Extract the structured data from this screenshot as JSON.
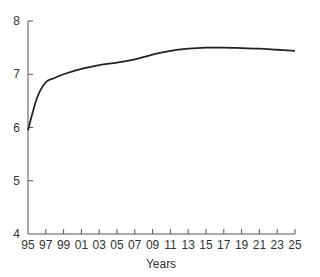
{
  "chart_data": {
    "type": "line",
    "title": "",
    "xlabel": "Years",
    "ylabel": "",
    "x_tick_labels": [
      "95",
      "97",
      "99",
      "01",
      "03",
      "05",
      "07",
      "09",
      "11",
      "13",
      "15",
      "17",
      "19",
      "21",
      "23",
      "25"
    ],
    "y_tick_labels": [
      "4",
      "5",
      "6",
      "7",
      "8"
    ],
    "ylim": [
      4,
      8
    ],
    "xlim": [
      1995,
      2025
    ],
    "grid": false,
    "legend": null,
    "series": [
      {
        "name": "value",
        "color": "#222222",
        "x": [
          1995,
          1996,
          1997,
          1998,
          1999,
          2001,
          2003,
          2005,
          2007,
          2009,
          2011,
          2013,
          2015,
          2017,
          2019,
          2021,
          2023,
          2025
        ],
        "values": [
          5.95,
          6.55,
          6.85,
          6.93,
          7.0,
          7.1,
          7.17,
          7.22,
          7.28,
          7.37,
          7.44,
          7.48,
          7.5,
          7.5,
          7.49,
          7.48,
          7.46,
          7.44
        ]
      }
    ]
  }
}
